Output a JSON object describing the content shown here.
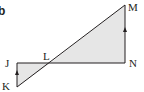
{
  "figure": {
    "part_label": "b",
    "colors": {
      "stroke": "#231f20",
      "fill": "#e6e6e6",
      "background": "#ffffff"
    },
    "points": {
      "J": {
        "label": "J",
        "x": 17,
        "y": 63
      },
      "K": {
        "label": "K",
        "x": 17,
        "y": 87
      },
      "L": {
        "label": "L",
        "x": 50,
        "y": 63
      },
      "M": {
        "label": "M",
        "x": 125,
        "y": 5
      },
      "N": {
        "label": "N",
        "x": 125,
        "y": 63
      }
    },
    "segments": [
      "K-M",
      "J-N",
      "J-K",
      "N-M"
    ],
    "shaded_triangles": [
      "J-K-L",
      "L-N-M"
    ],
    "parallel_arrows": [
      "K-J",
      "N-M"
    ]
  }
}
